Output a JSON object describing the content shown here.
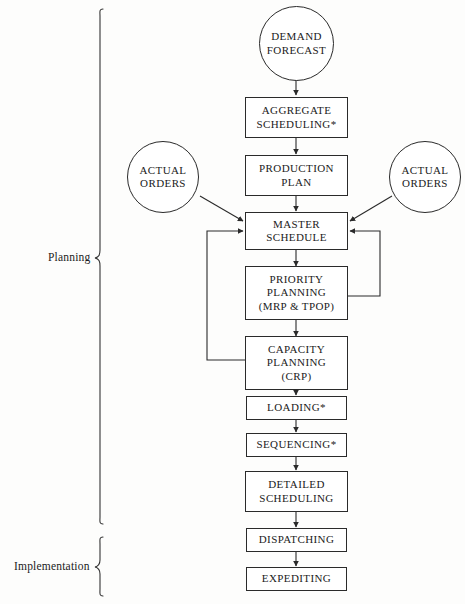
{
  "diagram": {
    "background_color": "#fdfdfc",
    "line_color": "#2a2a2a",
    "text_color": "#1b1b1b"
  },
  "group_labels": [
    {
      "id": "planning",
      "label": "Planning"
    },
    {
      "id": "implementation",
      "label": "Implementation"
    }
  ],
  "nodes": [
    {
      "id": "demand-forecast",
      "shape": "circle",
      "lines": [
        "DEMAND",
        "FORECAST"
      ]
    },
    {
      "id": "aggregate-scheduling",
      "shape": "box",
      "lines": [
        "AGGREGATE",
        "SCHEDULING*"
      ]
    },
    {
      "id": "production-plan",
      "shape": "box",
      "lines": [
        "PRODUCTION",
        "PLAN"
      ]
    },
    {
      "id": "actual-orders-left",
      "shape": "circle",
      "lines": [
        "ACTUAL",
        "ORDERS"
      ]
    },
    {
      "id": "actual-orders-right",
      "shape": "circle",
      "lines": [
        "ACTUAL",
        "ORDERS"
      ]
    },
    {
      "id": "master-schedule",
      "shape": "box",
      "lines": [
        "MASTER",
        "SCHEDULE"
      ]
    },
    {
      "id": "priority-planning",
      "shape": "box",
      "lines": [
        "PRIORITY",
        "PLANNING",
        "(MRP & TPOP)"
      ]
    },
    {
      "id": "capacity-planning",
      "shape": "box",
      "lines": [
        "CAPACITY",
        "PLANNING",
        "(CRP)"
      ]
    },
    {
      "id": "loading",
      "shape": "box",
      "lines": [
        "LOADING*"
      ]
    },
    {
      "id": "sequencing",
      "shape": "box",
      "lines": [
        "SEQUENCING*"
      ]
    },
    {
      "id": "detailed-scheduling",
      "shape": "box",
      "lines": [
        "DETAILED",
        "SCHEDULING"
      ]
    },
    {
      "id": "dispatching",
      "shape": "box",
      "lines": [
        "DISPATCHING"
      ]
    },
    {
      "id": "expediting",
      "shape": "box",
      "lines": [
        "EXPEDITING"
      ]
    }
  ],
  "edges": [
    {
      "from": "demand-forecast",
      "to": "aggregate-scheduling",
      "kind": "arrow-down"
    },
    {
      "from": "aggregate-scheduling",
      "to": "production-plan",
      "kind": "arrow-down"
    },
    {
      "from": "production-plan",
      "to": "master-schedule",
      "kind": "arrow-down"
    },
    {
      "from": "actual-orders-left",
      "to": "master-schedule",
      "kind": "arrow-diagonal"
    },
    {
      "from": "actual-orders-right",
      "to": "master-schedule",
      "kind": "arrow-diagonal"
    },
    {
      "from": "master-schedule",
      "to": "priority-planning",
      "kind": "arrow-down"
    },
    {
      "from": "priority-planning",
      "to": "capacity-planning",
      "kind": "arrow-down"
    },
    {
      "from": "priority-planning",
      "to": "master-schedule",
      "kind": "feedback-right"
    },
    {
      "from": "capacity-planning",
      "to": "master-schedule",
      "kind": "feedback-left"
    },
    {
      "from": "capacity-planning",
      "to": "loading",
      "kind": "arrow-down"
    },
    {
      "from": "loading",
      "to": "sequencing",
      "kind": "arrow-down"
    },
    {
      "from": "sequencing",
      "to": "detailed-scheduling",
      "kind": "arrow-down"
    },
    {
      "from": "detailed-scheduling",
      "to": "dispatching",
      "kind": "arrow-down"
    },
    {
      "from": "dispatching",
      "to": "expediting",
      "kind": "arrow-down"
    }
  ]
}
